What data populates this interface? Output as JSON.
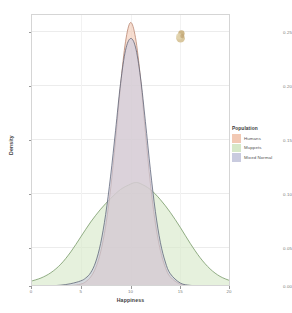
{
  "chart_data": {
    "type": "area",
    "title": "",
    "subtitle": "",
    "xlabel": "Happiness",
    "ylabel": "Density",
    "xlim": [
      0,
      20
    ],
    "ylim": [
      0.0,
      0.255
    ],
    "grid": true,
    "legend_position": "right",
    "legend_title": "Population",
    "x_ticks": [
      "0",
      "5",
      "10",
      "15",
      "20"
    ],
    "x_tick_values": [
      0,
      5,
      10,
      15,
      20
    ],
    "y_ticks": [
      "0.00",
      "0.05",
      "0.10",
      "0.15",
      "0.20",
      "0.25"
    ],
    "y_tick_values": [
      0.0,
      0.05,
      0.1,
      0.15,
      0.2,
      0.25
    ],
    "series": [
      {
        "name": "Humans",
        "fill": "#f2c9b4",
        "line": "#b4806a",
        "peak_x": 10.0,
        "peak_y": 0.247,
        "mean": 10.0,
        "sd": 1.62,
        "x": [
          0,
          1,
          2,
          3,
          4,
          5,
          5.5,
          6,
          6.5,
          7,
          7.5,
          8,
          8.5,
          9,
          9.5,
          10,
          10.5,
          11,
          11.5,
          12,
          12.5,
          13,
          13.5,
          14,
          15,
          16,
          17,
          18,
          19,
          20
        ],
        "values": [
          0.0,
          0.0,
          0.0,
          0.0,
          0.0003,
          0.0018,
          0.004,
          0.0085,
          0.017,
          0.032,
          0.056,
          0.091,
          0.137,
          0.188,
          0.229,
          0.247,
          0.233,
          0.195,
          0.144,
          0.096,
          0.059,
          0.0335,
          0.0175,
          0.0085,
          0.0016,
          0.0002,
          0.0,
          0.0,
          0.0,
          0.0
        ]
      },
      {
        "name": "Muppets",
        "fill": "#d6e8c8",
        "line": "#6f9460",
        "peak_x": 10.5,
        "peak_y": 0.097,
        "mean": 10.2,
        "sd": 4.1,
        "x": [
          0,
          1,
          2,
          3,
          4,
          5,
          6,
          7,
          8,
          9,
          10,
          10.5,
          11,
          12,
          13,
          14,
          15,
          16,
          17,
          18,
          19,
          20
        ],
        "values": [
          0.0045,
          0.0075,
          0.0125,
          0.0205,
          0.032,
          0.046,
          0.06,
          0.072,
          0.082,
          0.0905,
          0.0955,
          0.097,
          0.096,
          0.0905,
          0.081,
          0.069,
          0.055,
          0.04,
          0.0265,
          0.016,
          0.009,
          0.005
        ]
      },
      {
        "name": "Mixed Normal",
        "fill": "#c9cbdf",
        "line": "#5a5f73",
        "peak_x": 10.1,
        "peak_y": 0.232,
        "mean": 10.1,
        "sd": 1.72,
        "x": [
          0,
          1,
          2,
          3,
          4,
          5,
          5.5,
          6,
          6.5,
          7,
          7.5,
          8,
          8.5,
          9,
          9.5,
          10,
          10.5,
          11,
          11.5,
          12,
          12.5,
          13,
          13.5,
          14,
          15,
          16,
          17,
          18,
          19,
          20
        ],
        "values": [
          0.0,
          0.0,
          0.0002,
          0.0008,
          0.0022,
          0.0048,
          0.0075,
          0.0125,
          0.0225,
          0.04,
          0.067,
          0.103,
          0.146,
          0.19,
          0.221,
          0.232,
          0.224,
          0.196,
          0.154,
          0.109,
          0.07,
          0.041,
          0.0225,
          0.0115,
          0.0028,
          0.0006,
          0.0001,
          0.0,
          0.0,
          0.0
        ]
      }
    ],
    "annotations": [
      {
        "name": "stray-blob",
        "type": "image-artifact",
        "x": 16.1,
        "y": 0.232,
        "color": "#d8c79c"
      }
    ]
  },
  "legend": {
    "title": "Population",
    "items": [
      {
        "label": "Humans",
        "fill": "#f2c9b4",
        "line": "#b4806a"
      },
      {
        "label": "Muppets",
        "fill": "#d6e8c8",
        "line": "#6f9460"
      },
      {
        "label": "Mixed Normal",
        "fill": "#c9cbdf",
        "line": "#5a5f73"
      }
    ]
  },
  "axes": {
    "x_title": "Happiness",
    "y_title": "Density",
    "x_tick_labels": [
      "0",
      "5",
      "10",
      "15",
      "20"
    ],
    "y_tick_labels": [
      "0.00",
      "0.05",
      "0.10",
      "0.15",
      "0.20",
      "0.25"
    ]
  },
  "colors": {
    "panel_background": "#ffffff",
    "gridline": "#ececec",
    "panel_border": "#d5d5d5",
    "tick_text": "#7a7a7a",
    "axis_title": "#3c3c3c"
  }
}
